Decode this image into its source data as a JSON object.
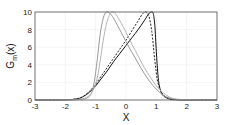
{
  "chart_data": {
    "type": "line",
    "title": "",
    "xlabel": "X",
    "ylabel": "G_m(x)",
    "xlim": [
      -3,
      3
    ],
    "ylim": [
      0,
      10
    ],
    "xticks": [
      -3,
      -2,
      -1,
      0,
      1,
      2,
      3
    ],
    "yticks": [
      0,
      2,
      4,
      6,
      8,
      10
    ],
    "grid": true,
    "legend": null,
    "series": [
      {
        "name": "solid-black",
        "color": "#111111",
        "dash": "",
        "x": [
          -3,
          -2,
          -1.6,
          -1.4,
          -1.2,
          -1.0,
          -0.8,
          -0.6,
          -0.4,
          -0.2,
          0.0,
          0.2,
          0.4,
          0.6,
          0.75,
          0.85,
          0.9,
          0.95,
          1.0,
          1.05,
          1.1,
          1.2,
          1.4,
          1.6,
          2,
          3
        ],
        "y": [
          0,
          0.02,
          0.15,
          0.4,
          0.9,
          1.6,
          2.5,
          3.4,
          4.4,
          5.3,
          6.2,
          7.1,
          8.0,
          9.0,
          9.8,
          10.0,
          9.8,
          8.5,
          5.5,
          3.0,
          1.6,
          0.6,
          0.15,
          0.04,
          0.01,
          0
        ]
      },
      {
        "name": "dashed-black",
        "color": "#222222",
        "dash": "2,1.5",
        "x": [
          -3,
          -2,
          -1.6,
          -1.4,
          -1.2,
          -1.0,
          -0.8,
          -0.6,
          -0.4,
          -0.2,
          0.0,
          0.2,
          0.4,
          0.55,
          0.65,
          0.75,
          0.85,
          0.95,
          1.05,
          1.2,
          1.4,
          1.6,
          2,
          3
        ],
        "y": [
          0,
          0.02,
          0.15,
          0.45,
          1.0,
          1.8,
          2.8,
          3.8,
          4.8,
          5.8,
          6.8,
          7.9,
          9.0,
          9.8,
          10.0,
          9.6,
          7.8,
          4.5,
          2.0,
          0.7,
          0.2,
          0.05,
          0.01,
          0
        ]
      },
      {
        "name": "gray-solid-1",
        "color": "#9a9a9a",
        "dash": "",
        "x": [
          -3,
          -2,
          -1.6,
          -1.3,
          -1.15,
          -1.05,
          -0.95,
          -0.85,
          -0.75,
          -0.65,
          -0.55,
          -0.45,
          -0.3,
          -0.1,
          0.1,
          0.3,
          0.5,
          0.7,
          0.9,
          1.1,
          1.3,
          1.6,
          2,
          3
        ],
        "y": [
          0,
          0.01,
          0.04,
          0.2,
          0.7,
          2.0,
          4.5,
          7.5,
          9.3,
          10.0,
          9.9,
          9.5,
          8.6,
          7.3,
          6.0,
          4.8,
          3.6,
          2.5,
          1.6,
          0.9,
          0.4,
          0.1,
          0.02,
          0
        ]
      },
      {
        "name": "gray-solid-2",
        "color": "#b5b5b5",
        "dash": "",
        "x": [
          -3,
          -2,
          -1.6,
          -1.3,
          -1.1,
          -0.95,
          -0.85,
          -0.75,
          -0.65,
          -0.55,
          -0.45,
          -0.35,
          -0.2,
          0.0,
          0.2,
          0.4,
          0.6,
          0.8,
          1.0,
          1.2,
          1.4,
          1.6,
          2,
          3
        ],
        "y": [
          0,
          0.01,
          0.05,
          0.3,
          1.0,
          2.5,
          4.5,
          6.8,
          8.6,
          9.6,
          10.0,
          9.8,
          9.0,
          7.7,
          6.3,
          5.0,
          3.7,
          2.6,
          1.6,
          0.9,
          0.4,
          0.15,
          0.03,
          0
        ]
      }
    ]
  }
}
